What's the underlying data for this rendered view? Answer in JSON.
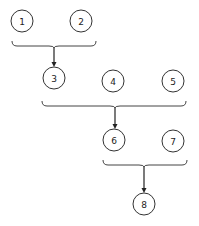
{
  "diagram": {
    "title": "",
    "colors": {
      "stroke": "#333333",
      "background": "#ffffff",
      "text": "#222222"
    },
    "nodes": [
      {
        "id": "1",
        "label": "1",
        "cx": 22,
        "cy": 21,
        "r": 11
      },
      {
        "id": "2",
        "label": "2",
        "cx": 81,
        "cy": 21,
        "r": 11
      },
      {
        "id": "3",
        "label": "3",
        "cx": 54,
        "cy": 78,
        "r": 11
      },
      {
        "id": "4",
        "label": "4",
        "cx": 113,
        "cy": 81,
        "r": 11
      },
      {
        "id": "5",
        "label": "5",
        "cx": 173,
        "cy": 81,
        "r": 11
      },
      {
        "id": "6",
        "label": "6",
        "cx": 114,
        "cy": 140,
        "r": 11
      },
      {
        "id": "7",
        "label": "7",
        "cx": 173,
        "cy": 141,
        "r": 11
      },
      {
        "id": "8",
        "label": "8",
        "cx": 144,
        "cy": 204,
        "r": 11
      }
    ],
    "groups": [
      {
        "members": [
          "1",
          "2"
        ],
        "x1": 12,
        "x2": 96,
        "y": 41,
        "tip": 54,
        "target": "3"
      },
      {
        "members": [
          "3",
          "4",
          "5"
        ],
        "x1": 42,
        "x2": 186,
        "y": 101,
        "tip": 115,
        "target": "6"
      },
      {
        "members": [
          "6",
          "7"
        ],
        "x1": 103,
        "x2": 187,
        "y": 160,
        "tip": 144,
        "target": "8"
      }
    ]
  }
}
